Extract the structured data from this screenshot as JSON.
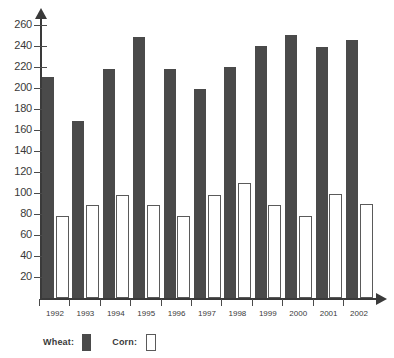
{
  "chart_data": {
    "type": "bar",
    "title": "",
    "xlabel": "",
    "ylabel": "",
    "categories": [
      "1992",
      "1993",
      "1994",
      "1995",
      "1996",
      "1997",
      "1998",
      "1999",
      "2000",
      "2001",
      "2002"
    ],
    "series": [
      {
        "name": "Wheat",
        "color": "#4a4a4a",
        "style": "filled",
        "values": [
          210,
          168,
          218,
          248,
          218,
          199,
          220,
          240,
          250,
          239,
          245
        ]
      },
      {
        "name": "Corn",
        "color": "#ffffff",
        "style": "outlined",
        "values": [
          78,
          88,
          98,
          88,
          78,
          98,
          109,
          88,
          78,
          99,
          89
        ]
      }
    ],
    "ylim": [
      0,
      270
    ],
    "y_ticks": [
      20,
      40,
      60,
      80,
      100,
      120,
      140,
      160,
      180,
      200,
      220,
      240,
      260
    ],
    "y_tick_labels": [
      "20",
      "40",
      "60",
      "80",
      "100",
      "120",
      "140",
      "160",
      "180",
      "200",
      "220",
      "240",
      "260"
    ],
    "grid": false,
    "legend_position": "bottom-left",
    "axis_color": "#3a3a3a"
  },
  "legend": {
    "wheat_label": "Wheat:",
    "corn_label": "Corn:"
  }
}
